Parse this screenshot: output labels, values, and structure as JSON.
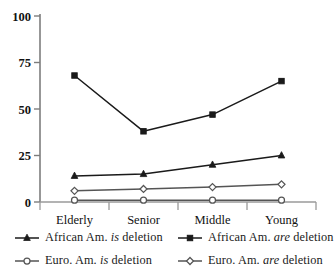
{
  "chart_data": {
    "type": "line",
    "title": "",
    "subtitle": "",
    "xlabel": "",
    "ylabel": "",
    "categories": [
      "Elderly",
      "Senior",
      "Middle",
      "Young"
    ],
    "ylim": [
      0,
      100
    ],
    "yticks": [
      0,
      25,
      50,
      75,
      100
    ],
    "ytick_labels": [
      "0",
      "25",
      "50",
      "75",
      "100"
    ],
    "grid": false,
    "legend_position": "bottom",
    "series": [
      {
        "name": "African Am. is deletion",
        "name_prefix": "African Am. ",
        "name_italic": "is",
        "name_suffix": " deletion",
        "marker": "filled-triangle",
        "color": "#1a1a1a",
        "values": [
          14,
          15,
          20,
          25
        ]
      },
      {
        "name": "African Am. are deletion",
        "name_prefix": "African Am. ",
        "name_italic": "are",
        "name_suffix": " deletion",
        "marker": "filled-square",
        "color": "#1a1a1a",
        "values": [
          68,
          38,
          47,
          65
        ]
      },
      {
        "name": "Euro. Am. is deletion",
        "name_prefix": "Euro. Am. ",
        "name_italic": "is",
        "name_suffix": " deletion",
        "marker": "open-circle",
        "color": "#555555",
        "values": [
          1,
          1,
          1,
          1
        ]
      },
      {
        "name": "Euro. Am. are deletion",
        "name_prefix": "Euro. Am. ",
        "name_italic": "are",
        "name_suffix": " deletion",
        "marker": "open-diamond",
        "color": "#555555",
        "values": [
          6,
          7,
          8,
          9.5
        ]
      }
    ]
  },
  "axis": {
    "y_labels": [
      "100",
      "75",
      "50",
      "25",
      "0"
    ],
    "x_labels": [
      "Elderly",
      "Senior",
      "Middle",
      "Young"
    ]
  },
  "legend": {
    "entries": [
      {
        "label": "African Am. is deletion",
        "marker": "filled-triangle"
      },
      {
        "label": "African Am. are deletion",
        "marker": "filled-square"
      },
      {
        "label": "Euro. Am. is deletion",
        "marker": "open-circle"
      },
      {
        "label": "Euro. Am. are deletion",
        "marker": "open-diamond"
      }
    ]
  }
}
